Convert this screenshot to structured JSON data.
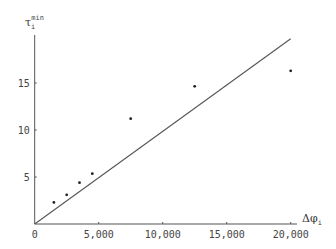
{
  "chart_data": {
    "type": "scatter",
    "title": "",
    "xlabel": "Δφ_i",
    "ylabel": "τ_i^min",
    "xlim": [
      0,
      21000
    ],
    "ylim": [
      0,
      20
    ],
    "x_ticks": [
      0,
      5000,
      10000,
      15000,
      20000
    ],
    "x_tick_labels": [
      "0",
      "5,000",
      "10,000",
      "15,000",
      "20,000"
    ],
    "y_ticks": [
      5,
      10,
      15
    ],
    "y_tick_labels": [
      "5",
      "10",
      "15"
    ],
    "grid": false,
    "legend": null,
    "series": [
      {
        "name": "observations",
        "kind": "scatter",
        "x": [
          1500,
          2500,
          3500,
          4500,
          7500,
          12500,
          20000
        ],
        "y": [
          2.3,
          3.1,
          4.4,
          5.35,
          11.2,
          14.65,
          16.3
        ]
      },
      {
        "name": "reference line",
        "kind": "line",
        "x": [
          0,
          20000
        ],
        "y": [
          0,
          19.7
        ]
      }
    ]
  },
  "labels": {
    "x_axis_main": "Δφ",
    "x_axis_sub": "i",
    "y_axis_main": "τ",
    "y_axis_sub": "i",
    "y_axis_sup": "min"
  },
  "colors": {
    "axis": "#555555",
    "points": "#222222",
    "line": "#555555"
  }
}
